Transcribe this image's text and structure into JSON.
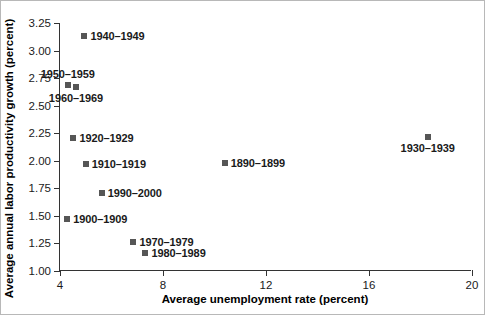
{
  "chart_data": {
    "type": "scatter",
    "title": "",
    "xlabel": "Average unemployment rate (percent)",
    "ylabel": "Average annual labor productivity growth (percent)",
    "xlim": [
      4,
      20
    ],
    "ylim": [
      1.0,
      3.25
    ],
    "xticks": [
      "4",
      "8",
      "12",
      "16",
      "20"
    ],
    "xtick_values": [
      4,
      8,
      12,
      16,
      20
    ],
    "yticks": [
      "1.00",
      "1.25",
      "1.50",
      "1.75",
      "2.00",
      "2.25",
      "2.50",
      "2.75",
      "3.00",
      "3.25"
    ],
    "ytick_values": [
      1.0,
      1.25,
      1.5,
      1.75,
      2.0,
      2.25,
      2.5,
      2.75,
      3.0,
      3.25
    ],
    "grid": false,
    "legend": "none",
    "marker_color": "#565656",
    "axis_color": "#333333",
    "background": "#ffffff",
    "points": [
      {
        "label": "1940–1949",
        "x": 4.95,
        "y": 3.13,
        "label_pos": "right"
      },
      {
        "label": "1950–1959",
        "x": 4.3,
        "y": 2.69,
        "label_pos": "above"
      },
      {
        "label": "1960–1969",
        "x": 4.62,
        "y": 2.67,
        "label_pos": "below"
      },
      {
        "label": "1920–1929",
        "x": 4.52,
        "y": 2.21,
        "label_pos": "right"
      },
      {
        "label": "1910–1919",
        "x": 5.0,
        "y": 1.97,
        "label_pos": "right"
      },
      {
        "label": "1890–1899",
        "x": 10.4,
        "y": 1.98,
        "label_pos": "right"
      },
      {
        "label": "1990–2000",
        "x": 5.62,
        "y": 1.71,
        "label_pos": "right"
      },
      {
        "label": "1900–1909",
        "x": 4.28,
        "y": 1.47,
        "label_pos": "right"
      },
      {
        "label": "1970–1979",
        "x": 6.85,
        "y": 1.26,
        "label_pos": "right"
      },
      {
        "label": "1980–1989",
        "x": 7.32,
        "y": 1.16,
        "label_pos": "right"
      },
      {
        "label": "1930–1939",
        "x": 18.28,
        "y": 2.22,
        "label_pos": "below"
      }
    ]
  }
}
